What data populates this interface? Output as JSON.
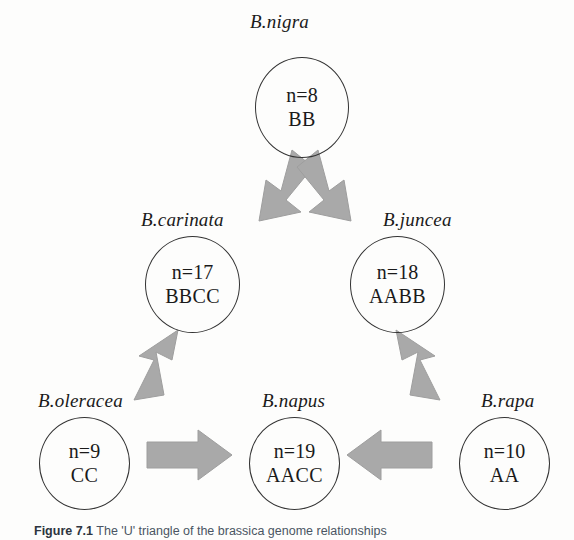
{
  "figure": {
    "caption_number": "Figure 7.1",
    "caption_text": "The 'U' triangle of the brassica genome relationships"
  },
  "colors": {
    "arrow_fill": "#a9a9a9",
    "arrow_stroke": "#9a9a9a",
    "circle_stroke": "#333333",
    "text": "#1a1a1a",
    "background": "#fdfdfc"
  },
  "nodes": [
    {
      "id": "b-nigra",
      "label": "B.nigra",
      "n": "n=8",
      "genome": "BB"
    },
    {
      "id": "b-carinata",
      "label": "B.carinata",
      "n": "n=17",
      "genome": "BBCC"
    },
    {
      "id": "b-juncea",
      "label": "B.juncea",
      "n": "n=18",
      "genome": "AABB"
    },
    {
      "id": "b-oleracea",
      "label": "B.oleracea",
      "n": "n=9",
      "genome": "CC"
    },
    {
      "id": "b-napus",
      "label": "B.napus",
      "n": "n=19",
      "genome": "AACC"
    },
    {
      "id": "b-rapa",
      "label": "B.rapa",
      "n": "n=10",
      "genome": "AA"
    }
  ],
  "arrows": [
    {
      "id": "nigra-to-carinata",
      "from": "B.nigra",
      "to": "B.carinata",
      "direction": "down-left"
    },
    {
      "id": "nigra-to-juncea",
      "from": "B.nigra",
      "to": "B.juncea",
      "direction": "down-right"
    },
    {
      "id": "oleracea-to-carinata",
      "from": "B.oleracea",
      "to": "B.carinata",
      "direction": "up-right"
    },
    {
      "id": "rapa-to-juncea",
      "from": "B.rapa",
      "to": "B.juncea",
      "direction": "up-left"
    },
    {
      "id": "oleracea-to-napus",
      "from": "B.oleracea",
      "to": "B.napus",
      "direction": "right"
    },
    {
      "id": "rapa-to-napus",
      "from": "B.rapa",
      "to": "B.napus",
      "direction": "left"
    }
  ]
}
